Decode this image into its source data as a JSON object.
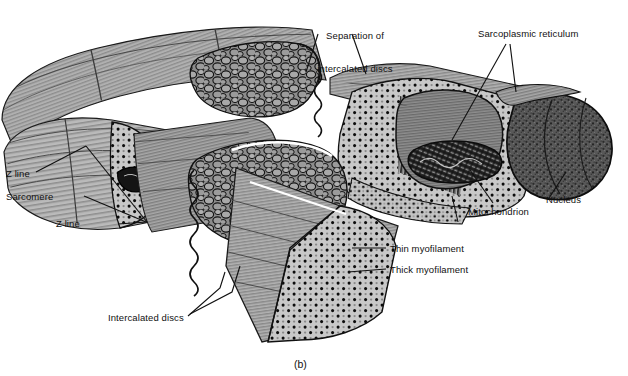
{
  "figure": {
    "caption": "(b)",
    "palette": {
      "fiber_light": "#c9c9c9",
      "fiber_mid": "#9e9e9e",
      "fiber_dark": "#6e6e6e",
      "stipple_bg": "#c6c6c6",
      "outline": "#111111",
      "nucleus": "#4a4a4a",
      "mitochondrion": "#2a2a2a",
      "background": "#ffffff",
      "highlight": "#ffffff"
    }
  },
  "labels": {
    "separation": {
      "line1": "Separation of",
      "line2": "intercalated discs"
    },
    "sarcoplasmic_reticulum": "Sarcoplasmic reticulum",
    "nucleus": "Nucleus",
    "mitochondrion": "Mitochondrion",
    "thin_myofilament": "Thin myofilament",
    "thick_myofilament": "Thick myofilament",
    "intercalated_discs": "Intercalated discs",
    "z_line_top": "Z line",
    "sarcomere": "Sarcomere",
    "z_line_bottom": "Z line"
  }
}
